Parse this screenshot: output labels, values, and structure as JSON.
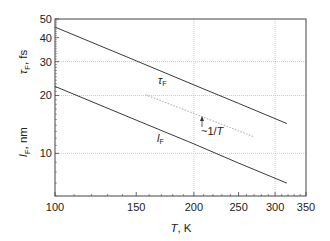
{
  "chart_data": {
    "type": "line",
    "title": "",
    "xlabel": "T, K",
    "xlabel_parts": {
      "var": "T",
      "unit": ", K"
    },
    "ylabel_top": "τF, fs",
    "ylabel_top_parts": {
      "var": "τ",
      "sub": "F",
      "unit": ", fs"
    },
    "ylabel_bottom": "lF, nm",
    "ylabel_bottom_parts": {
      "var": "l",
      "sub": "F",
      "unit": ", nm"
    },
    "xscale": "log",
    "yscale": "log",
    "xlim": [
      100,
      350
    ],
    "ylim": [
      6,
      50
    ],
    "x_ticks": [
      100,
      150,
      200,
      250,
      300,
      350
    ],
    "x_tick_labels": [
      "100",
      "150",
      "200",
      "250",
      "300",
      "350"
    ],
    "y_ticks": [
      10,
      20,
      30,
      40,
      50
    ],
    "y_tick_labels": [
      "10",
      "20",
      "30",
      "40",
      "50"
    ],
    "grid": {
      "x": [
        200,
        300
      ],
      "y": [
        10,
        20,
        30
      ],
      "style": "dotted"
    },
    "series": [
      {
        "name": "τF",
        "label_var": "τ",
        "label_sub": "F",
        "unit": "fs",
        "style": "solid",
        "x": [
          100,
          150,
          200,
          250,
          318
        ],
        "values": [
          45.4,
          30.3,
          22.7,
          18.2,
          14.3
        ]
      },
      {
        "name": "lF",
        "label_var": "l",
        "label_sub": "F",
        "unit": "nm",
        "style": "solid",
        "x": [
          100,
          150,
          200,
          250,
          318
        ],
        "values": [
          22.3,
          14.9,
          11.2,
          8.9,
          7.0
        ]
      },
      {
        "name": "~1/T reference",
        "style": "dotted",
        "x": [
          157,
          270
        ],
        "values": [
          20.2,
          12.2
        ]
      }
    ],
    "annotations": [
      {
        "text": "~1/T",
        "prefix": "~1/",
        "var": "T",
        "note": "arrow pointing to dotted reference line"
      }
    ],
    "legend": "none (inline labels)"
  },
  "colors": {
    "line": "#3a3a3a",
    "axis": "#444444",
    "grid": "#bdbdbd",
    "reference": "#b8b8b8"
  }
}
